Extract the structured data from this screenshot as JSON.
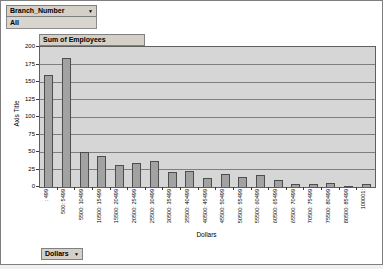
{
  "filters": {
    "branch_field": {
      "label": "Branch_Number",
      "dropdown_icon": "▼"
    },
    "branch_value": "All",
    "series_field": "Sum of Employees",
    "category_field": {
      "label": "Dollars",
      "dropdown_icon": "▼"
    }
  },
  "chart_data": {
    "type": "bar",
    "title": "",
    "series_name": "Sum of Employees",
    "xlabel": "Dollars",
    "ylabel": "Axis Title",
    "ylim": [
      0,
      200
    ],
    "yticks": [
      0,
      25,
      50,
      75,
      100,
      125,
      150,
      175,
      200
    ],
    "grid": true,
    "legend": "none",
    "categories": [
      ": 499",
      "500: 5499",
      "5500: 10499",
      "10500: 15499",
      "15500: 20499",
      "20500: 25499",
      "25500: 30499",
      "30500: 35499",
      "35500: 40499",
      "40500: 45499",
      "45500: 50499",
      "50500: 55499",
      "55500: 60499",
      "60500: 65499",
      "65500: 70499",
      "70500: 75499",
      "75500: 80499",
      "80500: 85499",
      "100001:"
    ],
    "values": [
      160,
      185,
      50,
      45,
      32,
      35,
      37,
      22,
      23,
      13,
      18,
      15,
      17,
      10,
      5,
      4,
      6,
      2,
      4
    ],
    "colors": {
      "bar_fill": "#a2a2a2",
      "bar_border": "#4d4d4d",
      "plot_bg": "#d6d6d6",
      "gridline": "#7f7f7f",
      "field_button_bg": "#d4d0c8"
    }
  }
}
